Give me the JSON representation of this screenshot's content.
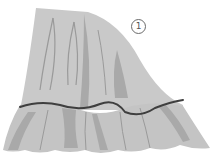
{
  "diagram": {
    "label": "1",
    "colors": {
      "fabric": "#c9c9c9",
      "fold_shadow": "#a9a9a9",
      "fold_line": "#9a9a9a",
      "seam_line": "#3f3f3f",
      "background": "#ffffff"
    }
  }
}
